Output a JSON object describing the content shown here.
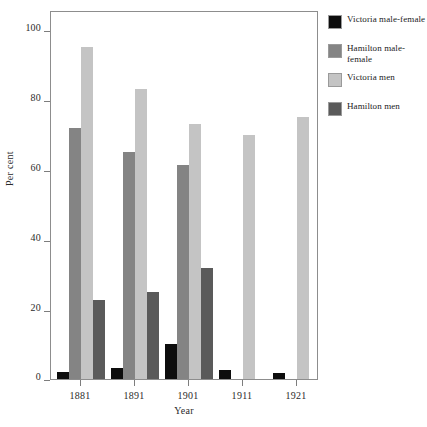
{
  "chart_data": {
    "type": "bar",
    "title": "",
    "subtitle": "",
    "xlabel": "Year",
    "ylabel": "Per cent",
    "categories": [
      "1881",
      "1891",
      "1901",
      "1911",
      "1921"
    ],
    "ylim": [
      0,
      100
    ],
    "yticks": [
      0,
      20,
      40,
      60,
      80,
      100
    ],
    "ytick_labels": [
      "0",
      "20",
      "40",
      "60",
      "80",
      "100"
    ],
    "grid": false,
    "legend_position": "right",
    "series": [
      {
        "name": "Victoria male-female",
        "color": "#0d0d0d",
        "values": [
          2,
          3,
          9.5,
          2.5,
          1.5
        ]
      },
      {
        "name": "Hamilton male-female",
        "color": "#848484",
        "values": [
          68,
          61.5,
          58,
          null,
          null
        ]
      },
      {
        "name": "Victoria men",
        "color": "#c4c4c4",
        "values": [
          90,
          78.5,
          69,
          66,
          71
        ]
      },
      {
        "name": "Hamilton men",
        "color": "#5a5a5a",
        "values": [
          21.5,
          23.5,
          30,
          null,
          null
        ]
      }
    ]
  },
  "legend": {
    "entries": [
      {
        "label": "Victoria male-female",
        "color": "#0d0d0d"
      },
      {
        "label": "Hamilton male-female",
        "color": "#848484"
      },
      {
        "label": "Victoria men",
        "color": "#c4c4c4"
      },
      {
        "label": "Hamilton men",
        "color": "#5a5a5a"
      }
    ]
  },
  "axes": {
    "y_title": "Per cent",
    "x_title": "Year",
    "y_tick_labels": [
      "100",
      "80",
      "60",
      "40",
      "20",
      "0"
    ],
    "x_tick_labels": [
      "1881",
      "1891",
      "1901",
      "1911",
      "1921"
    ]
  }
}
